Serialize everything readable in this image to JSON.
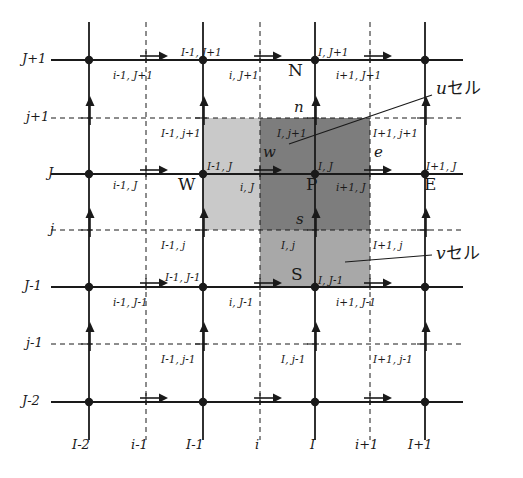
{
  "figure": {
    "type": "staggered-grid-control-volume-diagram"
  },
  "colors": {
    "line": "#1a1a1a",
    "u_cell": "#c9c9c9",
    "v_cell": "#a8a8a8",
    "overlap": "#7d7d7d",
    "background": "#ffffff"
  },
  "grid": {
    "x_axis_labels": [
      "I-2",
      "i-1",
      "I-1",
      "i",
      "I",
      "i+1",
      "I+1"
    ],
    "x_positions": [
      89,
      146,
      203,
      260,
      315,
      370,
      425
    ],
    "x_styles": [
      "solid",
      "dashed",
      "solid",
      "dashed",
      "solid",
      "dashed",
      "solid"
    ],
    "y_axis_labels": [
      "J+1",
      "j+1",
      "J",
      "j",
      "J-1",
      "j-1",
      "J-2"
    ],
    "y_positions": [
      60,
      118,
      174,
      230,
      287,
      344,
      402
    ],
    "y_styles": [
      "solid",
      "dashed",
      "solid",
      "dashed",
      "solid",
      "dashed",
      "solid"
    ]
  },
  "cells": {
    "u_cell": {
      "label_main": "u",
      "label_suffix": "セル",
      "x0": 203,
      "x1": 370,
      "y0": 118,
      "y1": 230
    },
    "v_cell": {
      "label_main": "v",
      "label_suffix": "セル",
      "x0": 260,
      "x1": 370,
      "y0": 118,
      "y1": 287
    }
  },
  "nodes": [
    {
      "name": "W",
      "label": "W",
      "x": 203,
      "y": 174
    },
    {
      "name": "P",
      "label": "P",
      "x": 315,
      "y": 174
    },
    {
      "name": "E",
      "label": "E",
      "x": 425,
      "y": 174
    },
    {
      "name": "N",
      "label": "N",
      "x": 315,
      "y": 60
    },
    {
      "name": "S",
      "label": "S",
      "x": 315,
      "y": 287
    }
  ],
  "faces": [
    {
      "name": "w",
      "label": "w",
      "x": 260,
      "y": 155
    },
    {
      "name": "e",
      "label": "e",
      "x": 370,
      "y": 155
    },
    {
      "name": "n",
      "label": "n",
      "x": 315,
      "y": 110
    },
    {
      "name": "s",
      "label": "s",
      "x": 315,
      "y": 222
    }
  ],
  "index_labels": [
    {
      "text": "I-1, J+1",
      "x": 181,
      "y": 47
    },
    {
      "text": "i-1, J+1",
      "x": 113,
      "y": 70
    },
    {
      "text": "I, J+1",
      "x": 318,
      "y": 47
    },
    {
      "text": "i, J+1",
      "x": 229,
      "y": 70
    },
    {
      "text": "i+1, J+1",
      "x": 336,
      "y": 70
    },
    {
      "text": "I-1, j+1",
      "x": 161,
      "y": 128
    },
    {
      "text": "I, j+1",
      "x": 277,
      "y": 128
    },
    {
      "text": "I+1, j+1",
      "x": 373,
      "y": 128
    },
    {
      "text": "I-1, J",
      "x": 207,
      "y": 161
    },
    {
      "text": "i-1, J",
      "x": 113,
      "y": 180
    },
    {
      "text": "I, J",
      "x": 318,
      "y": 161
    },
    {
      "text": "i, J",
      "x": 240,
      "y": 182
    },
    {
      "text": "i+1, J",
      "x": 336,
      "y": 182
    },
    {
      "text": "I+1, J",
      "x": 426,
      "y": 161
    },
    {
      "text": "I-1, j",
      "x": 161,
      "y": 240
    },
    {
      "text": "I, j",
      "x": 281,
      "y": 240
    },
    {
      "text": "I+1, j",
      "x": 373,
      "y": 240
    },
    {
      "text": "I-1, J-1",
      "x": 165,
      "y": 272
    },
    {
      "text": "i-1, J-1",
      "x": 113,
      "y": 297
    },
    {
      "text": "I, J-1",
      "x": 318,
      "y": 275
    },
    {
      "text": "i, J-1",
      "x": 229,
      "y": 297
    },
    {
      "text": "i+1, J-1",
      "x": 336,
      "y": 297
    },
    {
      "text": "I-1, j-1",
      "x": 161,
      "y": 354
    },
    {
      "text": "I, j-1",
      "x": 281,
      "y": 354
    },
    {
      "text": "I+1, j-1",
      "x": 373,
      "y": 354
    }
  ],
  "u_arrows": [
    {
      "x": 146,
      "y": 60
    },
    {
      "x": 260,
      "y": 60
    },
    {
      "x": 370,
      "y": 60
    },
    {
      "x": 146,
      "y": 174
    },
    {
      "x": 260,
      "y": 174
    },
    {
      "x": 370,
      "y": 174
    },
    {
      "x": 146,
      "y": 287
    },
    {
      "x": 260,
      "y": 287
    },
    {
      "x": 370,
      "y": 287
    },
    {
      "x": 146,
      "y": 402
    },
    {
      "x": 260,
      "y": 402
    },
    {
      "x": 370,
      "y": 402
    }
  ],
  "v_arrows": [
    {
      "x": 89,
      "y": 118
    },
    {
      "x": 203,
      "y": 118
    },
    {
      "x": 315,
      "y": 118
    },
    {
      "x": 425,
      "y": 118
    },
    {
      "x": 89,
      "y": 230
    },
    {
      "x": 203,
      "y": 230
    },
    {
      "x": 315,
      "y": 230
    },
    {
      "x": 425,
      "y": 230
    },
    {
      "x": 89,
      "y": 344
    },
    {
      "x": 203,
      "y": 344
    },
    {
      "x": 315,
      "y": 344
    },
    {
      "x": 425,
      "y": 344
    }
  ],
  "node_dots": [
    {
      "x": 89,
      "y": 60
    },
    {
      "x": 203,
      "y": 60
    },
    {
      "x": 315,
      "y": 60
    },
    {
      "x": 425,
      "y": 60
    },
    {
      "x": 89,
      "y": 174
    },
    {
      "x": 203,
      "y": 174
    },
    {
      "x": 315,
      "y": 174
    },
    {
      "x": 425,
      "y": 174
    },
    {
      "x": 89,
      "y": 287
    },
    {
      "x": 203,
      "y": 287
    },
    {
      "x": 315,
      "y": 287
    },
    {
      "x": 425,
      "y": 287
    },
    {
      "x": 89,
      "y": 402
    },
    {
      "x": 203,
      "y": 402
    },
    {
      "x": 315,
      "y": 402
    },
    {
      "x": 425,
      "y": 402
    }
  ],
  "leaders": {
    "u": {
      "x1": 289,
      "y1": 144,
      "x2": 432,
      "y2": 95
    },
    "v": {
      "x1": 345,
      "y1": 262,
      "x2": 432,
      "y2": 255
    }
  }
}
